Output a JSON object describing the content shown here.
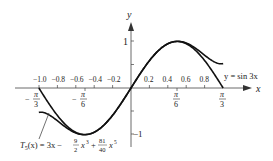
{
  "chart_data": {
    "type": "line",
    "title": "",
    "xlabel": "x",
    "ylabel": "y",
    "xlim": [
      -1.15,
      1.3
    ],
    "ylim": [
      -1.15,
      1.35
    ],
    "grid": false,
    "x_ticks_top": [
      "-1.0",
      "-0.8",
      "-0.6",
      "-0.4",
      "-0.2",
      "0.2",
      "0.4",
      "0.6",
      "0.8"
    ],
    "x_tick_values": [
      -1.0,
      -0.8,
      -0.6,
      -0.4,
      -0.2,
      0.2,
      0.4,
      0.6,
      0.8
    ],
    "x_ticks_pi": [
      {
        "label": "-π/3",
        "value": -1.0472
      },
      {
        "label": "-π/6",
        "value": -0.5236
      },
      {
        "label": "π/6",
        "value": 0.5236
      },
      {
        "label": "π/3",
        "value": 1.0472
      }
    ],
    "y_ticks": [
      {
        "label": "1",
        "value": 1
      },
      {
        "label": "-1",
        "value": -1
      }
    ],
    "series": [
      {
        "name": "y = sin 3x",
        "function": "sin(3x)",
        "domain": [
          -1.0472,
          1.0472
        ]
      },
      {
        "name": "T5(x) = 3x - (9/2)x^3 + (81/40)x^5",
        "function": "3x - 4.5x^3 + 2.025x^5",
        "domain": [
          -1.0472,
          1.0472
        ]
      }
    ],
    "annotations": [
      {
        "text": "y = sin 3x",
        "position": "right, near (0.85, 0.2)"
      },
      {
        "text": "T5(x) = 3x − (9/2)x³ + (81/40)x⁵",
        "position": "bottom left with leader line to curve near x=-0.95"
      }
    ]
  },
  "labels": {
    "x_axis": "x",
    "y_axis": "y",
    "y_one": "1",
    "y_neg_one": "−1",
    "sin_label": "y = sin 3x",
    "taylor_label_prefix": "T",
    "taylor_label_sub": "5",
    "taylor_label_rest": "(x) = 3x −",
    "frac1_num": "9",
    "frac1_den": "2",
    "x3": "x",
    "x3_exp": "3",
    "plus": "+",
    "frac2_num": "81",
    "frac2_den": "40",
    "x5": "x",
    "x5_exp": "5",
    "ticks_top": [
      "−1.0",
      "−0.8",
      "−0.6",
      "−0.4",
      "−0.2",
      "0.2",
      "0.4",
      "0.6",
      "0.8"
    ],
    "pi_num": "π",
    "den3": "3",
    "den6": "6",
    "minus": "−"
  }
}
